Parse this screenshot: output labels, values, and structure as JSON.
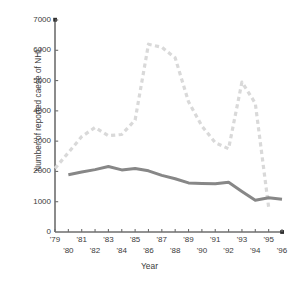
{
  "chart_data": {
    "type": "line",
    "title": "",
    "xlabel": "Year",
    "ylabel": "Number of reported caese of NHL",
    "xlim": [
      1979,
      1996
    ],
    "ylim": [
      0,
      7000
    ],
    "grid": false,
    "legend": "none",
    "y_ticks": [
      0,
      1000,
      2000,
      3000,
      4000,
      5000,
      6000,
      7000
    ],
    "y_tick_labels": [
      "0",
      "1000",
      "2000",
      "3000",
      "4000",
      "5000",
      "6000",
      "7000"
    ],
    "x_ticks": [
      1979,
      1980,
      1981,
      1982,
      1983,
      1984,
      1985,
      1986,
      1987,
      1988,
      1989,
      1990,
      1991,
      1992,
      1993,
      1994,
      1995,
      1996
    ],
    "x_tick_labels": [
      "'79",
      "'80",
      "'81",
      "'82",
      "'83",
      "'84",
      "'85",
      "'86",
      "'87",
      "'88",
      "'89",
      "'90",
      "'91",
      "'92",
      "'93",
      "'94",
      "'95",
      "'96"
    ],
    "x_tick_label_rows": [
      0,
      1,
      0,
      1,
      0,
      1,
      0,
      1,
      0,
      1,
      0,
      1,
      0,
      1,
      0,
      1,
      0,
      1
    ],
    "colors": {
      "dashed_series": "#d9d9d9",
      "solid_series": "#878787",
      "axis": "#6e6e6e",
      "text": "#3b3b3b"
    },
    "series": [
      {
        "name": "dashed-series",
        "style": "dashed",
        "color": "#d9d9d9",
        "x": [
          1979,
          1980,
          1981,
          1982,
          1983,
          1984,
          1985,
          1986,
          1987,
          1988,
          1989,
          1990,
          1991,
          1992,
          1993,
          1994,
          1995
        ],
        "values": [
          2100,
          2620,
          3150,
          3450,
          3180,
          3220,
          3700,
          6200,
          6100,
          5750,
          4300,
          3500,
          2950,
          2750,
          4950,
          4250,
          820
        ]
      },
      {
        "name": "solid-series",
        "style": "solid",
        "color": "#878787",
        "x": [
          1980,
          1981,
          1982,
          1983,
          1984,
          1985,
          1986,
          1987,
          1988,
          1989,
          1990,
          1991,
          1992,
          1993,
          1994,
          1995,
          1996
        ],
        "values": [
          1890,
          1980,
          2060,
          2160,
          2050,
          2100,
          2020,
          1870,
          1760,
          1620,
          1600,
          1590,
          1640,
          1340,
          1050,
          1130,
          1080
        ]
      }
    ]
  }
}
